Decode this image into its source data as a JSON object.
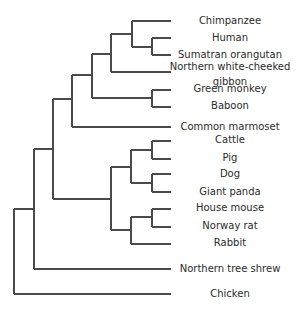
{
  "diagram": {
    "type": "phylogenetic-tree",
    "line_color": "#4a4a4a",
    "text_color": "#2b2b2b",
    "leaf_end_x": 171,
    "label_center_x": 230
  },
  "leaves": [
    {
      "id": "chimpanzee",
      "label": "Chimpanzee",
      "y": 21,
      "x_start": 132,
      "label_y": 21
    },
    {
      "id": "human",
      "label": "Human",
      "y": 38,
      "x_start": 152,
      "label_y": 38
    },
    {
      "id": "sumatran-orangutan",
      "label": "Sumatran orangutan",
      "y": 55,
      "x_start": 152,
      "label_y": 55
    },
    {
      "id": "northern-white-cheeked-gibbon",
      "label": "Northern white-cheeked",
      "label2": "gibbon",
      "y": 72,
      "x_start": 111,
      "label_y": 67,
      "label2_y": 82
    },
    {
      "id": "green-monkey",
      "label": "Green monkey",
      "y": 90,
      "x_start": 152,
      "label_y": 89
    },
    {
      "id": "baboon",
      "label": "Baboon",
      "y": 107,
      "x_start": 152,
      "label_y": 106
    },
    {
      "id": "common-marmoset",
      "label": "Common marmoset",
      "y": 127,
      "x_start": 72,
      "label_y": 127
    },
    {
      "id": "cattle",
      "label": "Cattle",
      "y": 141,
      "x_start": 152,
      "label_y": 140
    },
    {
      "id": "pig",
      "label": "Pig",
      "y": 159,
      "x_start": 152,
      "label_y": 158
    },
    {
      "id": "dog",
      "label": "Dog",
      "y": 174,
      "x_start": 152,
      "label_y": 174
    },
    {
      "id": "giant-panda",
      "label": "Giant panda",
      "y": 192,
      "x_start": 152,
      "label_y": 192
    },
    {
      "id": "house-mouse",
      "label": "House mouse",
      "y": 209,
      "x_start": 152,
      "label_y": 208
    },
    {
      "id": "norway-rat",
      "label": "Norway rat",
      "y": 227,
      "x_start": 152,
      "label_y": 226
    },
    {
      "id": "rabbit",
      "label": "Rabbit",
      "y": 244,
      "x_start": 131,
      "label_y": 243
    },
    {
      "id": "northern-tree-shrew",
      "label": "Northern tree shrew",
      "y": 269,
      "x_start": 34,
      "label_y": 269
    },
    {
      "id": "chicken",
      "label": "Chicken",
      "y": 294,
      "x_start": 14,
      "label_y": 294
    }
  ],
  "nodes": [
    {
      "id": "human-orangutan",
      "x": 152,
      "y_top": 38,
      "y_bottom": 55,
      "parent_x": 132,
      "y": 47
    },
    {
      "id": "great-apes",
      "x": 132,
      "y_top": 21,
      "y_bottom": 47,
      "parent_x": 111,
      "y": 34
    },
    {
      "id": "hominoidea",
      "x": 111,
      "y_top": 34,
      "y_bottom": 72,
      "parent_x": 92,
      "y": 54
    },
    {
      "id": "green-monkey-baboon",
      "x": 152,
      "y_top": 90,
      "y_bottom": 107,
      "parent_x": 92,
      "y": 98
    },
    {
      "id": "catarrhini",
      "x": 92,
      "y_top": 54,
      "y_bottom": 98,
      "parent_x": 72,
      "y": 75
    },
    {
      "id": "primates",
      "x": 72,
      "y_top": 75,
      "y_bottom": 127,
      "parent_x": 53,
      "y": 99
    },
    {
      "id": "cattle-pig",
      "x": 152,
      "y_top": 141,
      "y_bottom": 159,
      "parent_x": 131,
      "y": 150
    },
    {
      "id": "dog-panda",
      "x": 152,
      "y_top": 174,
      "y_bottom": 192,
      "parent_x": 131,
      "y": 183
    },
    {
      "id": "laurasiatheria",
      "x": 131,
      "y_top": 150,
      "y_bottom": 183,
      "parent_x": 111,
      "y": 167
    },
    {
      "id": "mouse-rat",
      "x": 152,
      "y_top": 209,
      "y_bottom": 227,
      "parent_x": 131,
      "y": 217
    },
    {
      "id": "glires",
      "x": 131,
      "y_top": 217,
      "y_bottom": 244,
      "parent_x": 111,
      "y": 230
    },
    {
      "id": "laurasia-glires",
      "x": 111,
      "y_top": 167,
      "y_bottom": 230,
      "parent_x": 53,
      "y": 199
    },
    {
      "id": "placental-core",
      "x": 53,
      "y_top": 99,
      "y_bottom": 199,
      "parent_x": 34,
      "y": 149
    },
    {
      "id": "with-tree-shrew",
      "x": 34,
      "y_top": 149,
      "y_bottom": 269,
      "parent_x": 14,
      "y": 209
    },
    {
      "id": "root",
      "x": 14,
      "y_top": 209,
      "y_bottom": 294,
      "parent_x": null,
      "y": 251
    }
  ]
}
